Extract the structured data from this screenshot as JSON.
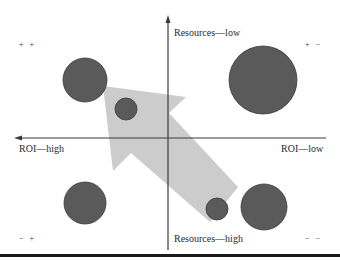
{
  "diagram": {
    "type": "quadrant-bubble-diagram",
    "axes": {
      "vertical_top_label": "Resources—low",
      "vertical_bottom_label": "Resources—high",
      "horizontal_left_label": "ROI—high",
      "horizontal_right_label": "ROI—low"
    },
    "quadrant_signs": {
      "top_left": "+ +",
      "top_right": "+ −",
      "bottom_left": "− +",
      "bottom_right": "− −"
    },
    "bubbles": [
      {
        "quadrant": "top-left",
        "cx": 85,
        "cy": 80,
        "r": 22
      },
      {
        "quadrant": "top-left",
        "cx": 126,
        "cy": 109,
        "r": 11
      },
      {
        "quadrant": "top-right",
        "cx": 263,
        "cy": 80,
        "r": 34
      },
      {
        "quadrant": "bottom-left",
        "cx": 85,
        "cy": 203,
        "r": 21
      },
      {
        "quadrant": "bottom-right",
        "cx": 217,
        "cy": 209,
        "r": 11
      },
      {
        "quadrant": "bottom-right",
        "cx": 264,
        "cy": 207,
        "r": 23
      }
    ],
    "arrow": {
      "direction": "from bottom-right toward top-left",
      "color": "#c8c8c8"
    },
    "colors": {
      "bubble_fill": "#5a5a5a",
      "bubble_stroke": "#3a3a3a",
      "arrow_fill": "#c9c9c9",
      "axis": "#3a3a3a"
    }
  }
}
